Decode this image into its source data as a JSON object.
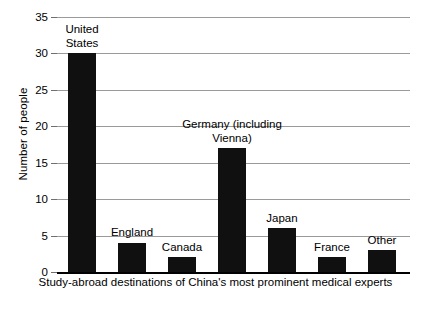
{
  "chart_data": {
    "type": "bar",
    "title": "",
    "subtitle": "",
    "xlabel": "Study-abroad destinations of China's most prominent medical experts",
    "ylabel": "Number of people",
    "categories": [
      "United States",
      "England",
      "Canada",
      "Germany (including Vienna)",
      "Japan",
      "France",
      "Other"
    ],
    "category_labels_multiline": [
      "United\nStates",
      "England",
      "Canada",
      "Germany (including\nVienna)",
      "Japan",
      "France",
      "Other"
    ],
    "values": [
      30,
      4,
      2,
      17,
      6,
      2,
      3
    ],
    "ylim": [
      0,
      35
    ],
    "yticks": [
      0,
      5,
      10,
      15,
      20,
      25,
      30,
      35
    ],
    "ytick_labels": [
      "0",
      "5",
      "10",
      "15",
      "20",
      "25",
      "30",
      "35"
    ],
    "grid": true,
    "grid_axis": "y",
    "legend": false,
    "bar_color": "#101010",
    "grid_color": "#9a9a9a",
    "axis_color": "#000000",
    "background_color": "#ffffff"
  }
}
